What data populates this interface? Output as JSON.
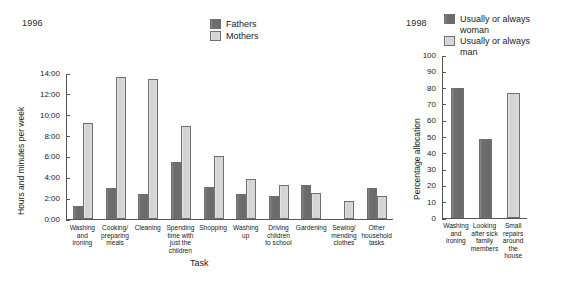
{
  "figure": {
    "background": "#ffffff",
    "dark_color": "#6a6a6a",
    "light_color": "#d6d6d6"
  },
  "left_panel": {
    "year": "1996",
    "ylabel": "Hours and minutes per week",
    "xlabel": "Task",
    "legend": [
      {
        "label": "Fathers",
        "style": "dark"
      },
      {
        "label": "Mothers",
        "style": "light"
      }
    ]
  },
  "right_panel": {
    "year": "1998",
    "ylabel": "Percentage allocation",
    "legend": [
      {
        "label": "Usually or always\nwoman",
        "style": "dark"
      },
      {
        "label": "Usually or always\nman",
        "style": "light"
      }
    ]
  },
  "chart_data": [
    {
      "type": "bar",
      "id": "left-chart",
      "title": "1996",
      "xlabel": "Task",
      "ylabel": "Hours and minutes per week",
      "ytick_labels": [
        "14:00",
        "12:00",
        "10:00",
        "8:00",
        "6:00",
        "4:00",
        "2:00",
        "0:00"
      ],
      "ytick_values": [
        14,
        12,
        10,
        8,
        6,
        4,
        2,
        0
      ],
      "ylim": [
        0,
        14
      ],
      "grid": false,
      "legend_position": "top-right",
      "categories": [
        "Washing\nand\nironing",
        "Cooking/\npreparing\nmeals",
        "Cleaning",
        "Spending\ntime with\njust the\nchildren",
        "Shopping",
        "Washing\nup",
        "Driving\nchildren\nto school",
        "Gardening",
        "Sewing/\nmending\nclothes",
        "Other\nhousehold\ntasks"
      ],
      "series": [
        {
          "name": "Fathers",
          "style": "dark",
          "values": [
            1.3,
            3.0,
            2.4,
            5.5,
            3.1,
            2.4,
            2.2,
            3.3,
            0.0,
            3.0
          ]
        },
        {
          "name": "Mothers",
          "style": "light",
          "values": [
            9.3,
            13.7,
            13.5,
            9.0,
            6.1,
            3.9,
            3.3,
            2.5,
            1.7,
            2.2
          ]
        }
      ]
    },
    {
      "type": "bar",
      "id": "right-chart",
      "title": "1998",
      "xlabel": "",
      "ylabel": "Percentage allocation",
      "ytick_labels": [
        "100",
        "90",
        "80",
        "70",
        "60",
        "50",
        "40",
        "30",
        "20",
        "10",
        "0"
      ],
      "ytick_values": [
        100,
        90,
        80,
        70,
        60,
        50,
        40,
        30,
        20,
        10,
        0
      ],
      "ylim": [
        0,
        100
      ],
      "grid": false,
      "legend_position": "top-right",
      "categories": [
        "Washing\nand\nironing",
        "Looking\nafter sick\nfamily\nmembers",
        "Small repairs\naround the\nhouse"
      ],
      "bars": [
        {
          "category": "Washing and ironing",
          "value": 80,
          "style": "dark"
        },
        {
          "category": "Looking after sick family members",
          "value": 49,
          "style": "dark"
        },
        {
          "category": "Small repairs around the house",
          "value": 77,
          "style": "light"
        }
      ]
    }
  ]
}
